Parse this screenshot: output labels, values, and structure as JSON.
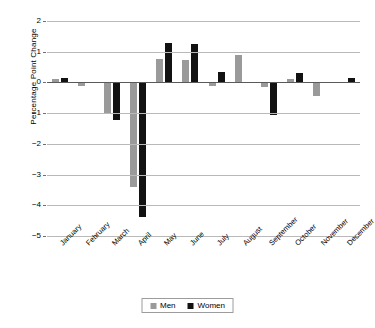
{
  "chart_data": {
    "type": "bar",
    "title": "",
    "xlabel": "",
    "ylabel": "Percentage Point Change",
    "categories": [
      "January",
      "February",
      "March",
      "April",
      "May",
      "June",
      "July",
      "August",
      "September",
      "October",
      "November",
      "December"
    ],
    "series": [
      {
        "name": "Men",
        "color": "#9a9a9a",
        "values": [
          0.1,
          -0.12,
          -1.0,
          -3.4,
          0.75,
          0.74,
          -0.12,
          0.88,
          -0.15,
          0.1,
          -0.45,
          0.0
        ]
      },
      {
        "name": "Women",
        "color": "#121212",
        "values": [
          0.15,
          0.0,
          -1.22,
          -4.37,
          1.27,
          1.24,
          0.33,
          0.0,
          -1.05,
          0.32,
          0.0,
          0.13
        ]
      }
    ],
    "ylim": [
      -5,
      2
    ],
    "yticks": [
      "2",
      "1",
      "0",
      "−1",
      "−2",
      "−3",
      "−4",
      "−5"
    ],
    "ytick_values": [
      2,
      1,
      0,
      -1,
      -2,
      -3,
      -4,
      -5
    ],
    "grid": true,
    "legend_position": "bottom"
  },
  "legend": {
    "items": [
      {
        "label": "Men",
        "swatch": "men-swatch"
      },
      {
        "label": "Women",
        "swatch": "women-swatch"
      }
    ]
  }
}
